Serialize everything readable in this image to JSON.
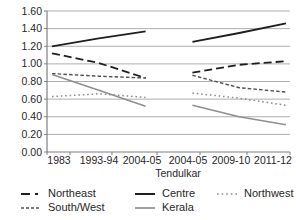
{
  "chart_data": {
    "type": "line",
    "title": "",
    "xlabel": "Tendulkar",
    "ylabel": "",
    "ylim": [
      0,
      1.6
    ],
    "y_tick_step": 0.2,
    "y_tick_labels": [
      "0.00",
      "0.20",
      "0.40",
      "0.60",
      "0.80",
      "1.00",
      "1.20",
      "1.40",
      "1.60"
    ],
    "categories": [
      "1983",
      "1993-94",
      "2004-05",
      "2004-05",
      "2009-10",
      "2011-12"
    ],
    "panel_split_index": 3,
    "grid": true,
    "legend_position": "bottom",
    "series": [
      {
        "name": "Northeast",
        "style": "long-dash",
        "color": "#1f1f1f",
        "width": 1.8,
        "values": [
          1.12,
          1.01,
          0.84,
          0.9,
          0.99,
          1.03
        ]
      },
      {
        "name": "Centre",
        "style": "solid",
        "color": "#1f1f1f",
        "width": 1.8,
        "values": [
          1.2,
          1.29,
          1.37,
          1.25,
          1.35,
          1.46
        ]
      },
      {
        "name": "Northwest",
        "style": "dotted",
        "color": "#8c8c8c",
        "width": 1.5,
        "values": [
          0.63,
          0.66,
          0.62,
          0.67,
          0.61,
          0.53
        ]
      },
      {
        "name": "South/West",
        "style": "short-dash",
        "color": "#4f4f4f",
        "width": 1.4,
        "values": [
          0.89,
          0.86,
          0.84,
          0.87,
          0.73,
          0.68
        ]
      },
      {
        "name": "Kerala",
        "style": "solid",
        "color": "#8f8f8f",
        "width": 1.5,
        "values": [
          0.88,
          0.7,
          0.52,
          0.53,
          0.4,
          0.31
        ]
      }
    ],
    "legend_order": [
      "Northeast",
      "Centre",
      "Northwest",
      "South/West",
      "Kerala"
    ]
  },
  "colors": {
    "background": "#ffffff",
    "gridline": "#aeaeae",
    "axis": "#7f7f7f",
    "tick_text": "#262626"
  }
}
